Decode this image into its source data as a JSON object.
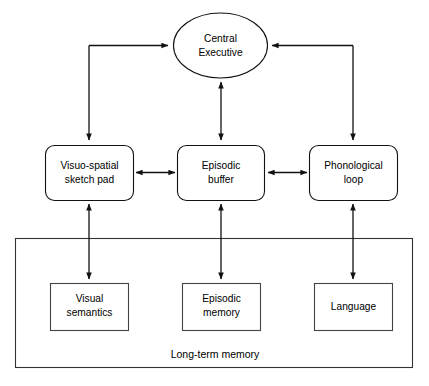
{
  "diagram": {
    "background_color": "#ffffff",
    "stroke_color": "#111111",
    "text_color": "#000000",
    "central_executive": {
      "label_line1": "Central",
      "label_line2": "Executive",
      "shape": "ellipse"
    },
    "subsystems": [
      {
        "id": "visuo-spatial-sketch-pad",
        "label_line1": "Visuo-spatial",
        "label_line2": "sketch pad",
        "shape": "rounded-rect"
      },
      {
        "id": "episodic-buffer",
        "label_line1": "Episodic",
        "label_line2": "buffer",
        "shape": "rounded-rect"
      },
      {
        "id": "phonological-loop",
        "label_line1": "Phonological",
        "label_line2": "loop",
        "shape": "rounded-rect"
      }
    ],
    "long_term_memory": {
      "caption": "Long-term memory",
      "stores": [
        {
          "id": "visual-semantics",
          "label_line1": "Visual",
          "label_line2": "semantics",
          "shape": "rect"
        },
        {
          "id": "episodic-memory",
          "label_line1": "Episodic",
          "label_line2": "memory",
          "shape": "rect"
        },
        {
          "id": "language",
          "label_line1": "Language",
          "label_line2": "",
          "shape": "rect"
        }
      ]
    },
    "connections": [
      {
        "id": "sketchpad-to-central-executive",
        "from": "visuo-spatial-sketch-pad",
        "to": "central-executive",
        "direction": "one-way-elbow"
      },
      {
        "id": "central-executive-to-sketchpad",
        "from": "central-executive",
        "to": "visuo-spatial-sketch-pad",
        "direction": "one-way-elbow"
      },
      {
        "id": "central-executive-episodic-buffer",
        "from": "central-executive",
        "to": "episodic-buffer",
        "direction": "two-way"
      },
      {
        "id": "phonological-loop-to-central-executive",
        "from": "phonological-loop",
        "to": "central-executive",
        "direction": "one-way-elbow"
      },
      {
        "id": "sketchpad-episodic-buffer",
        "from": "visuo-spatial-sketch-pad",
        "to": "episodic-buffer",
        "direction": "two-way"
      },
      {
        "id": "episodic-buffer-phonological-loop",
        "from": "episodic-buffer",
        "to": "phonological-loop",
        "direction": "two-way"
      },
      {
        "id": "sketchpad-visual-semantics",
        "from": "visuo-spatial-sketch-pad",
        "to": "visual-semantics",
        "direction": "two-way"
      },
      {
        "id": "episodic-buffer-episodic-memory",
        "from": "episodic-buffer",
        "to": "episodic-memory",
        "direction": "two-way"
      },
      {
        "id": "phonological-loop-language",
        "from": "phonological-loop",
        "to": "language",
        "direction": "two-way"
      }
    ]
  }
}
